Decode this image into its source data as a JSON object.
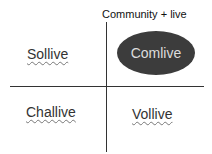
{
  "diagram": {
    "title": "Community + live",
    "quadrants": {
      "top_left": "Sollive",
      "top_right": "Comlive",
      "bottom_left": "Challive",
      "bottom_right": "Vollive"
    },
    "highlight_color": "#3c3c3c"
  }
}
